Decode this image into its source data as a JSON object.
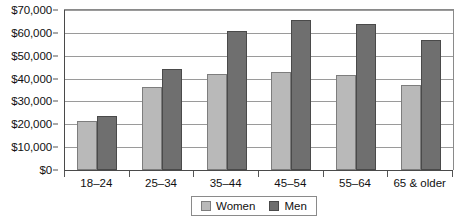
{
  "chart_data": {
    "type": "bar",
    "title": "",
    "subtitle": "",
    "xlabel": "",
    "ylabel": "",
    "categories": [
      "18–24",
      "25–34",
      "35–44",
      "45–54",
      "55–64",
      "65 & older"
    ],
    "series": [
      {
        "name": "Women",
        "color": "#b9b9b9",
        "values": [
          21500,
          36500,
          42000,
          43000,
          41500,
          37000
        ]
      },
      {
        "name": "Men",
        "color": "#6f6f6f",
        "values": [
          23500,
          44000,
          61000,
          65500,
          64000,
          57000
        ]
      }
    ],
    "ylim": [
      0,
      70000
    ],
    "ytick_values": [
      0,
      10000,
      20000,
      30000,
      40000,
      50000,
      60000,
      70000
    ],
    "ytick_labels": [
      "$0",
      "$10,000",
      "$20,000",
      "$30,000",
      "$40,000",
      "$50,000",
      "$60,000",
      "$70,000"
    ],
    "grid": true,
    "legend_position": "bottom"
  },
  "legend": {
    "entries": [
      {
        "label": "Women"
      },
      {
        "label": "Men"
      }
    ]
  }
}
